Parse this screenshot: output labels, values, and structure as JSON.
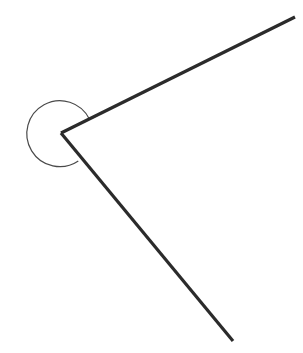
{
  "canvas": {
    "width": 303,
    "height": 353,
    "background_color": "#ffffff",
    "title": "Reflex angle diagram"
  },
  "figure": {
    "type": "angle-diagram",
    "vertex": {
      "name": "vertex",
      "x": 61,
      "y": 133
    },
    "rays": [
      {
        "name": "upper-right-ray",
        "from": {
          "x": 61,
          "y": 133
        },
        "to": {
          "x": 295,
          "y": 17
        },
        "color": "#2b2b2b",
        "width": 3.2
      },
      {
        "name": "lower-right-ray",
        "from": {
          "x": 61,
          "y": 133
        },
        "to": {
          "x": 233,
          "y": 341
        },
        "color": "#2b2b2b",
        "width": 3.2
      }
    ],
    "arc": {
      "name": "reflex-angle-arc",
      "center": {
        "x": 61,
        "y": 133
      },
      "radius": 33,
      "start_point": {
        "x": 89,
        "y": 119
      },
      "end_point": {
        "x": 78,
        "y": 161
      },
      "sweep": "counterclockwise-outer",
      "large_arc": true,
      "color": "#4a4a4a",
      "width": 1.2,
      "path": "M 89.5 119.2 A 33 33 0 1 0 78.3 161.0"
    },
    "angle": {
      "interior_degrees": 76,
      "reflex_degrees": 284,
      "marked": "reflex"
    },
    "colors": {
      "stroke_dark": "#2b2b2b",
      "stroke_light": "#4a4a4a",
      "background": "#ffffff"
    }
  }
}
